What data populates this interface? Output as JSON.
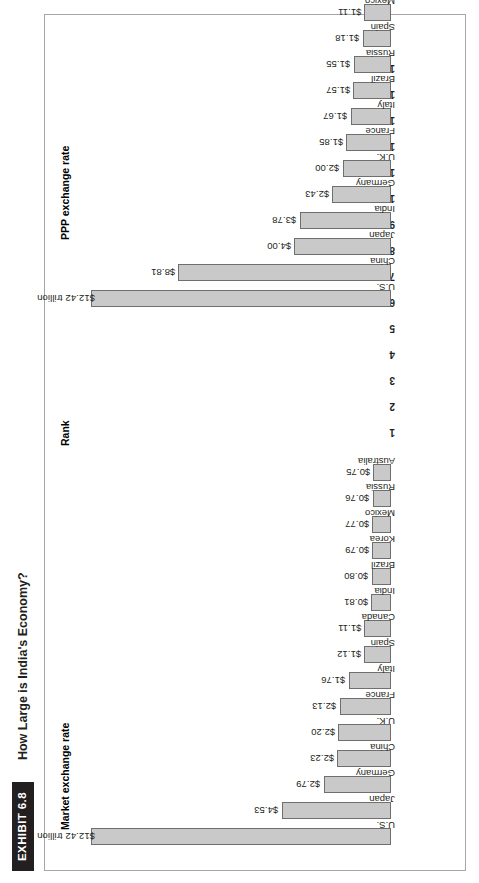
{
  "exhibit": {
    "tag": "EXHIBIT 6.8",
    "title": "How Large is India's Economy?"
  },
  "headers": {
    "market": "Market exchange rate",
    "rank": "Rank",
    "ppp": "PPP exchange rate"
  },
  "colors": {
    "bar_fill": "#c9c9c9",
    "bar_stroke": "#6f6f6f",
    "tag_bg": "#231f20",
    "frame_border": "#a6a6a6"
  },
  "ranks": [
    "1",
    "2",
    "3",
    "4",
    "5",
    "6",
    "7",
    "8",
    "9",
    "10",
    "11",
    "12",
    "13",
    "14",
    "15"
  ],
  "chart_data": [
    {
      "type": "bar",
      "title": "Market exchange rate",
      "xlabel": "",
      "ylabel": "",
      "ylim": [
        0,
        12.42
      ],
      "grid": false,
      "legend": false,
      "categories": [
        "U.S.",
        "Japan",
        "Germany",
        "China",
        "U.K.",
        "France",
        "Italy",
        "Spain",
        "Canada",
        "India",
        "Brazil",
        "Korea",
        "Mexico",
        "Russia",
        "Australia"
      ],
      "values": [
        12.42,
        4.53,
        2.79,
        2.23,
        2.2,
        2.13,
        1.76,
        1.12,
        1.11,
        0.81,
        0.8,
        0.79,
        0.77,
        0.76,
        0.75
      ],
      "labels": [
        "$12.42 trillion",
        "$4.53",
        "$2.79",
        "$2.23",
        "$2.20",
        "$2.13",
        "$1.76",
        "$1.12",
        "$1.11",
        "$0.81",
        "$0.80",
        "$0.79",
        "$0.77",
        "$0.76",
        "$0.75"
      ],
      "label_inside": [
        true,
        false,
        false,
        false,
        false,
        false,
        false,
        false,
        false,
        false,
        false,
        false,
        false,
        false,
        false
      ]
    },
    {
      "type": "bar",
      "title": "PPP exchange rate",
      "xlabel": "",
      "ylabel": "",
      "ylim": [
        0,
        12.42
      ],
      "grid": false,
      "legend": false,
      "categories": [
        "U.S.",
        "China",
        "Japan",
        "India",
        "Germany",
        "U.K.",
        "France",
        "Italy",
        "Brazil",
        "Russia",
        "Spain",
        "Mexico",
        "Canada",
        "Korea",
        "Indonesia"
      ],
      "values": [
        12.42,
        8.81,
        4.0,
        3.78,
        2.43,
        2.0,
        1.85,
        1.67,
        1.57,
        1.55,
        1.18,
        1.11,
        1.08,
        1.06,
        0.85
      ],
      "labels": [
        "$12.42 trillion",
        "$8.81",
        "$4.00",
        "$3.78",
        "$2.43",
        "$2.00",
        "$1.85",
        "$1.67",
        "$1.57",
        "$1.55",
        "$1.18",
        "$1.11",
        "$1.08",
        "$1.06",
        "$0.85"
      ],
      "label_inside": [
        true,
        false,
        false,
        false,
        false,
        false,
        false,
        false,
        false,
        false,
        false,
        false,
        false,
        false,
        false
      ]
    }
  ]
}
